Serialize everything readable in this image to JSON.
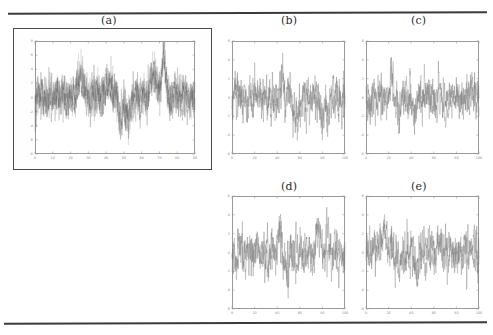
{
  "figure": {
    "background_color": "#ffffff",
    "rule_color": "#3a3a3a",
    "axis_color": "#9a9a9a",
    "frame_color": "#4a4a4a",
    "trace_colors": [
      "#6f6f6f",
      "#8c8c8c",
      "#a6a6a6",
      "#585858"
    ]
  },
  "captions": {
    "a": "(a)",
    "b": "(b)",
    "c": "(c)",
    "d": "(d)",
    "e": "(e)"
  },
  "chart_data": [
    {
      "id": "a",
      "type": "line",
      "title": "(a)",
      "xlabel": "",
      "ylabel": "",
      "xlim": [
        0,
        90
      ],
      "ylim": [
        -8,
        8
      ],
      "xticks": [
        0,
        10,
        20,
        30,
        40,
        50,
        60,
        70,
        80,
        90
      ],
      "xticklabels": [
        "0",
        "10",
        "20",
        "30",
        "40",
        "50",
        "60",
        "70",
        "80",
        "90"
      ],
      "yticks": [
        -8,
        -6,
        -4,
        -2,
        0,
        2,
        4,
        6,
        8
      ],
      "yticklabels": [
        "-8",
        "-6",
        "-4",
        "-2",
        "0",
        "2",
        "4",
        "6",
        "8"
      ],
      "grid": false,
      "legend": "none",
      "n_traces": 4,
      "description": "Dense overlapping noisy time series, heavy excursion near x=40 reaching about -8, large positive spike near x=80 reaching about 6",
      "series": [
        {
          "name": "trace-1",
          "seed": 11,
          "amplitude": 1.6,
          "values": [
            0.2,
            1.1,
            -0.6,
            0.9,
            -1.4,
            0.5,
            1.8,
            -0.9,
            0.3,
            -1.7,
            1.2,
            0.4,
            -1.1,
            2.0,
            -0.5,
            0.8,
            -1.9,
            1.3,
            0.1,
            -0.8,
            1.5,
            -1.2,
            0.6,
            1.9,
            -0.4,
            -1.6,
            0.9,
            0.2,
            -2.1,
            1.4,
            0.7,
            -1.0,
            1.1,
            -0.3,
            2.2,
            -1.5,
            0.5,
            -0.9,
            1.7,
            -4.6,
            -1.2,
            0.8,
            -0.2,
            1.3,
            -1.8,
            0.4,
            1.0,
            -0.7,
            2.1,
            -1.3,
            0.6,
            -0.1,
            1.6,
            -2.0,
            0.9,
            0.3,
            -1.4,
            1.2,
            -0.5,
            1.8,
            -1.1,
            0.7,
            -2.3,
            1.5,
            0.2,
            -0.8,
            1.0,
            -1.6,
            0.5,
            2.4,
            -0.9,
            1.3,
            -0.4,
            0.8,
            -1.7,
            1.1,
            0.6,
            3.4,
            -1.2,
            0.9,
            -0.3,
            2.8,
            -1.5,
            1.4,
            0.5,
            -0.7,
            1.9,
            -1.0,
            0.8
          ]
        },
        {
          "name": "trace-2",
          "seed": 27,
          "amplitude": 1.5,
          "values": []
        },
        {
          "name": "trace-3",
          "seed": 43,
          "amplitude": 1.7,
          "values": []
        },
        {
          "name": "trace-4",
          "seed": 59,
          "amplitude": 1.4,
          "values": []
        }
      ]
    },
    {
      "id": "b",
      "type": "line",
      "title": "(b)",
      "xlabel": "",
      "ylabel": "",
      "xlim": [
        0,
        100
      ],
      "ylim": [
        -6,
        6
      ],
      "xticks": [
        0,
        20,
        40,
        60,
        80,
        100
      ],
      "xticklabels": [
        "0",
        "20",
        "40",
        "60",
        "80",
        "100"
      ],
      "yticks": [
        -6,
        -4,
        -2,
        0,
        2,
        4,
        6
      ],
      "yticklabels": [
        "-6",
        "-4",
        "-2",
        "0",
        "2",
        "4",
        "6"
      ],
      "grid": false,
      "legend": "none",
      "n_traces": 2,
      "description": "Two overlapping noisy series centered near 0, deep negative excursion near x=40 reaching about -4.5, scattered dips near x=65 and x=75"
    },
    {
      "id": "c",
      "type": "line",
      "title": "(c)",
      "xlabel": "",
      "ylabel": "",
      "xlim": [
        0,
        100
      ],
      "ylim": [
        -6,
        6
      ],
      "xticks": [
        0,
        20,
        40,
        60,
        80,
        100
      ],
      "xticklabels": [
        "0",
        "20",
        "40",
        "60",
        "80",
        "100"
      ],
      "yticks": [
        -6,
        -4,
        -2,
        0,
        2,
        4,
        6
      ],
      "yticklabels": [
        "-6",
        "-4",
        "-2",
        "0",
        "2",
        "4",
        "6"
      ],
      "grid": false,
      "legend": "none",
      "n_traces": 2,
      "description": "Two overlapping noisy series centered near 0 with smaller variance, moderate dip near x=55 and positive spike near x=80"
    },
    {
      "id": "d",
      "type": "line",
      "title": "(d)",
      "xlabel": "",
      "ylabel": "",
      "xlim": [
        0,
        100
      ],
      "ylim": [
        -6,
        6
      ],
      "xticks": [
        0,
        20,
        40,
        60,
        80,
        100
      ],
      "xticklabels": [
        "0",
        "20",
        "40",
        "60",
        "80",
        "100"
      ],
      "yticks": [
        -6,
        -4,
        -2,
        0,
        2,
        4,
        6
      ],
      "yticklabels": [
        "-6",
        "-4",
        "-2",
        "0",
        "2",
        "4",
        "6"
      ],
      "grid": false,
      "legend": "none",
      "n_traces": 2,
      "description": "Two overlapping noisy series centered near 0, broad negative dips near x=55 and x=62 reaching about -4"
    },
    {
      "id": "e",
      "type": "line",
      "title": "(e)",
      "xlabel": "",
      "ylabel": "",
      "xlim": [
        0,
        100
      ],
      "ylim": [
        -6,
        6
      ],
      "xticks": [
        0,
        20,
        40,
        60,
        80,
        100
      ],
      "xticklabels": [
        "0",
        "20",
        "40",
        "60",
        "80",
        "100"
      ],
      "yticks": [
        -6,
        -4,
        -2,
        0,
        2,
        4,
        6
      ],
      "yticklabels": [
        "-6",
        "-4",
        "-2",
        "0",
        "2",
        "4",
        "6"
      ],
      "grid": false,
      "legend": "none",
      "n_traces": 2,
      "description": "Two overlapping noisy series centered near 0, dip near x=62 reaching about -3.5 and spikes near x=40 and x=85"
    }
  ]
}
